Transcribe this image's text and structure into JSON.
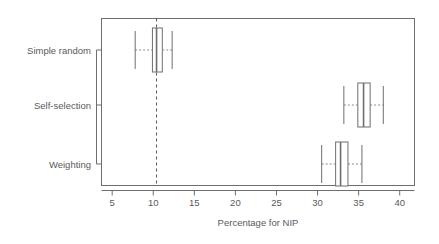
{
  "chart_data": {
    "type": "box",
    "title": "",
    "subtitle": "",
    "xlabel": "Percentage for NIP",
    "ylabel": "",
    "xlim": [
      3.7,
      41.8
    ],
    "xticks": [
      5,
      10,
      15,
      20,
      25,
      30,
      35,
      40
    ],
    "xtick_labels": [
      "5",
      "10",
      "15",
      "20",
      "25",
      "30",
      "35",
      "40"
    ],
    "grid": false,
    "legend": null,
    "orientation": "horizontal",
    "categories": [
      "Simple random",
      "Self-selection",
      "Weighting"
    ],
    "reference_line": {
      "value": 10.4,
      "style": "dashed",
      "orientation": "vertical",
      "color": "#555555"
    },
    "boxes": [
      {
        "category": "Simple random",
        "whisker_low": 7.8,
        "q1": 9.9,
        "median": 10.4,
        "q3": 11.1,
        "whisker_high": 12.3,
        "outliers": []
      },
      {
        "category": "Self-selection",
        "whisker_low": 33.2,
        "q1": 34.9,
        "median": 35.6,
        "q3": 36.4,
        "whisker_high": 38.0,
        "outliers": []
      },
      {
        "category": "Weighting",
        "whisker_low": 30.5,
        "q1": 32.2,
        "median": 32.8,
        "q3": 33.7,
        "whisker_high": 35.4,
        "outliers": []
      }
    ]
  },
  "colors": {
    "box_fill": "#ffffff",
    "box_stroke": "#6e6e6e",
    "axis": "#6e6e6e",
    "text": "#5a5a5a",
    "reference": "#555555",
    "background": "#ffffff"
  }
}
